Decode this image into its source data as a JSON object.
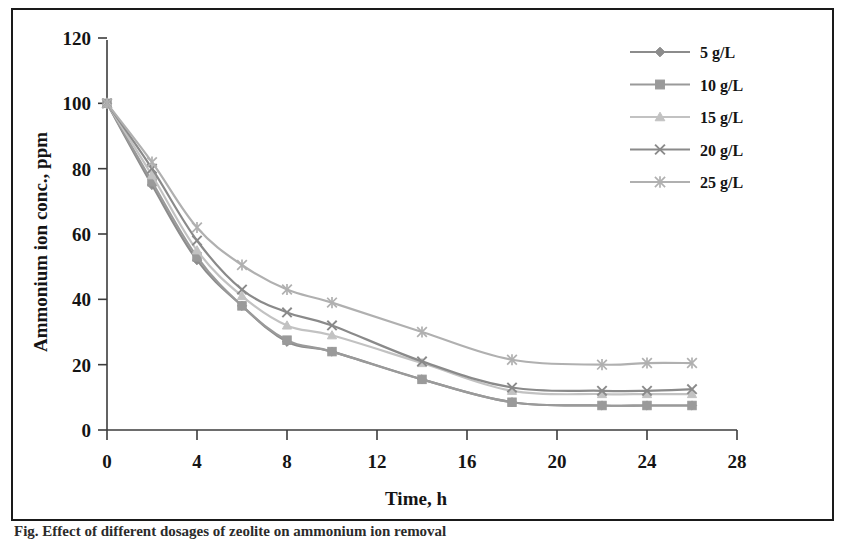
{
  "figure": {
    "caption_fragment": "Fig.  Effect of different dosages of zeolite on ammonium ion removal"
  },
  "chart_data": {
    "type": "line",
    "title": "",
    "xlabel": "Time, h",
    "ylabel": "Ammonium ion conc., ppm",
    "xlim": [
      0,
      28
    ],
    "ylim": [
      0,
      120
    ],
    "xticks": [
      0,
      4,
      8,
      12,
      16,
      20,
      24,
      28
    ],
    "yticks": [
      0,
      20,
      40,
      60,
      80,
      100,
      120
    ],
    "grid": false,
    "legend_position": "top-right",
    "x": [
      0,
      2,
      4,
      6,
      8,
      10,
      14,
      18,
      22,
      24,
      26
    ],
    "series": [
      {
        "name": "5 g/L",
        "marker": "diamond",
        "color": "#8c8c8c",
        "values": [
          100,
          75,
          52,
          38,
          27,
          24,
          15.5,
          8.5,
          7.5,
          7.5,
          7.5
        ]
      },
      {
        "name": "10 g/L",
        "marker": "square",
        "color": "#9a9a9a",
        "values": [
          100,
          76,
          53,
          38,
          27.5,
          24,
          15.5,
          8.5,
          7.5,
          7.5,
          7.5
        ]
      },
      {
        "name": "15 g/L",
        "marker": "triangle",
        "color": "#c2c2c2",
        "values": [
          100,
          78,
          55,
          41,
          32,
          29,
          20.5,
          12,
          11,
          11,
          11
        ]
      },
      {
        "name": "20 g/L",
        "marker": "x",
        "color": "#8a8a8a",
        "values": [
          100,
          80,
          58,
          43,
          36,
          32,
          21,
          13,
          12,
          12,
          12.5
        ]
      },
      {
        "name": "25 g/L",
        "marker": "asterisk",
        "color": "#b0b0b0",
        "values": [
          100,
          82,
          62,
          50.5,
          43,
          39,
          30,
          21.5,
          20,
          20.5,
          20.5
        ]
      }
    ]
  },
  "axes": {
    "x_tick_labels": [
      "0",
      "4",
      "8",
      "12",
      "16",
      "20",
      "24",
      "28"
    ],
    "y_tick_labels": [
      "0",
      "20",
      "40",
      "60",
      "80",
      "100",
      "120"
    ],
    "x_axis_title": "Time, h",
    "y_axis_title": "Ammonium ion conc., ppm"
  },
  "legend": {
    "entries": [
      {
        "label": "5 g/L"
      },
      {
        "label": "10 g/L"
      },
      {
        "label": "15 g/L"
      },
      {
        "label": "20 g/L"
      },
      {
        "label": "25 g/L"
      }
    ]
  },
  "style": {
    "frame_color": "#1a1a1a",
    "axis_color": "#3c3c3c",
    "background": "#ffffff"
  }
}
